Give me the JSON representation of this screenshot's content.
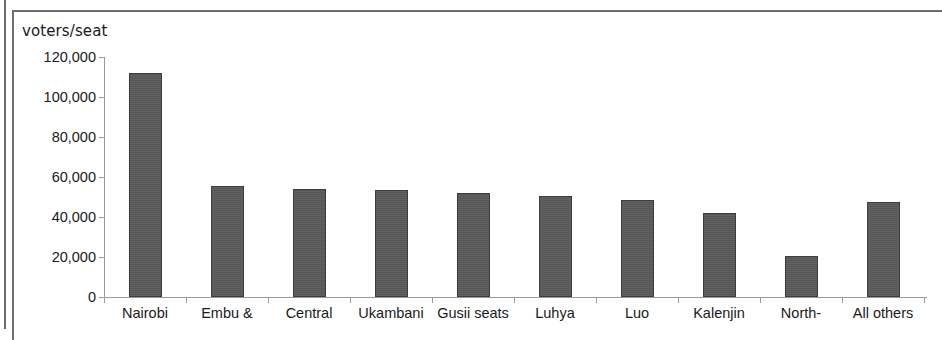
{
  "chart_data": {
    "type": "bar",
    "title": "",
    "ylabel": "voters/seat",
    "xlabel": "",
    "ylim": [
      0,
      120000
    ],
    "ytick_labels": [
      "120,000",
      "100,000",
      "80,000",
      "60,000",
      "40,000",
      "20,000",
      "0"
    ],
    "ytick_values": [
      120000,
      100000,
      80000,
      60000,
      40000,
      20000,
      0
    ],
    "grid": false,
    "legend": "none",
    "categories": [
      "Nairobi",
      "Embu &",
      "Central",
      "Ukambani",
      "Gusii seats",
      "Luhya",
      "Luo",
      "Kalenjin",
      "North-",
      "All others"
    ],
    "values": [
      112000,
      55500,
      54000,
      53500,
      52000,
      50500,
      48500,
      42000,
      20500,
      47500
    ],
    "bar_color": "#595959",
    "bar_outline_color": "#3d3d3d",
    "axis_color": "#9a9a9a"
  }
}
